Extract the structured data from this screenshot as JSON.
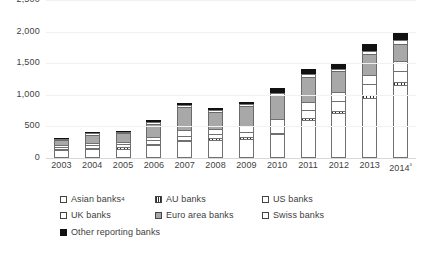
{
  "chart_data": {
    "type": "bar",
    "stacked": true,
    "title": "",
    "subtitle": "",
    "xlabel": "",
    "ylabel": "",
    "ylim": [
      0,
      2500
    ],
    "yticks": [
      0,
      500,
      1000,
      1500,
      2000,
      2500
    ],
    "ytick_labels": [
      "0",
      "500",
      "1,000",
      "1,500",
      "2,000",
      "2,500"
    ],
    "grid": true,
    "legend_position": "bottom",
    "categories": [
      "2003",
      "2004",
      "2005",
      "2006",
      "2007",
      "2008",
      "2009",
      "2010",
      "2011",
      "2012",
      "2013",
      "2014"
    ],
    "category_labels": [
      "2003",
      "2004",
      "2005",
      "2006",
      "2007",
      "2008",
      "2009",
      "2010",
      "2011",
      "2012",
      "2013",
      "2014³"
    ],
    "series": [
      {
        "name": "Asian banks⁴",
        "key": "asian",
        "fill": "white",
        "values": [
          130,
          140,
          150,
          205,
          265,
          290,
          305,
          375,
          600,
          705,
          950,
          1150
        ]
      },
      {
        "name": "AU banks",
        "key": "au",
        "fill": "hatched",
        "values": [
          20,
          20,
          20,
          20,
          20,
          20,
          20,
          25,
          40,
          45,
          50,
          55
        ]
      },
      {
        "name": "US banks",
        "key": "us",
        "fill": "white",
        "values": [
          30,
          40,
          45,
          55,
          70,
          75,
          90,
          110,
          125,
          150,
          165,
          175
        ]
      },
      {
        "name": "UK banks",
        "key": "uk",
        "fill": "white",
        "values": [
          25,
          35,
          40,
          55,
          85,
          75,
          90,
          110,
          125,
          140,
          155,
          160
        ]
      },
      {
        "name": "Euro area banks",
        "key": "euro",
        "fill": "grey",
        "values": [
          80,
          135,
          140,
          210,
          375,
          270,
          320,
          370,
          400,
          330,
          325,
          265
        ]
      },
      {
        "name": "Swiss banks",
        "key": "swiss",
        "fill": "white",
        "values": [
          10,
          15,
          20,
          25,
          25,
          30,
          30,
          40,
          45,
          45,
          55,
          60
        ]
      },
      {
        "name": "Other reporting banks",
        "key": "other",
        "fill": "black",
        "values": [
          15,
          15,
          20,
          30,
          35,
          35,
          35,
          75,
          70,
          75,
          105,
          125
        ]
      }
    ],
    "totals": [
      310,
      400,
      435,
      600,
      875,
      795,
      890,
      1105,
      1405,
      1490,
      1805,
      1990
    ]
  },
  "legend": {
    "rows": [
      [
        {
          "label": "Asian banks",
          "sup": "4",
          "fill": "white"
        },
        {
          "label": "AU banks",
          "sup": "",
          "fill": "hatched"
        },
        {
          "label": "US banks",
          "sup": "",
          "fill": "white"
        }
      ],
      [
        {
          "label": "UK banks",
          "sup": "",
          "fill": "white"
        },
        {
          "label": "Euro area banks",
          "sup": "",
          "fill": "grey"
        },
        {
          "label": "Swiss banks",
          "sup": "",
          "fill": "white"
        }
      ],
      [
        {
          "label": "Other reporting banks",
          "sup": "",
          "fill": "black"
        }
      ]
    ]
  },
  "colors": {
    "grey_fill": "#a8a8a8",
    "black_fill": "#111111",
    "white_fill": "#ffffff",
    "border": "#707070",
    "gridline": "#f1f1f1",
    "text": "#3d3d3d"
  }
}
